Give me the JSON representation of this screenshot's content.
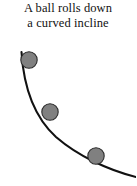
{
  "figure": {
    "width": 136,
    "height": 186,
    "background_color": "#ffffff"
  },
  "caption": {
    "line1": "A ball rolls down",
    "line2": "a curved incline",
    "full_text": "A ball rolls down a curved incline",
    "text_color": "#111111"
  },
  "diagram": {
    "name": "curved-incline-with-rolling-ball",
    "incline": {
      "label": "curved incline",
      "stroke_color": "#111111",
      "stroke_width": 2.1,
      "path": "M 21.5 52 C 23.5 84, 33 116, 56 137 C 78 156, 108 170, 136 177",
      "start_point": [
        21.5,
        52
      ],
      "end_point": [
        136,
        177
      ]
    },
    "balls": [
      {
        "label": "ball-position-1",
        "cx": 29,
        "cy": 60,
        "r": 8.2,
        "fill_color": "#808080",
        "stroke_color": "#2b2b2b"
      },
      {
        "label": "ball-position-2",
        "cx": 50,
        "cy": 112,
        "r": 8.2,
        "fill_color": "#808080",
        "stroke_color": "#2b2b2b"
      },
      {
        "label": "ball-position-3",
        "cx": 96,
        "cy": 156,
        "r": 8.2,
        "fill_color": "#808080",
        "stroke_color": "#2b2b2b"
      }
    ]
  }
}
